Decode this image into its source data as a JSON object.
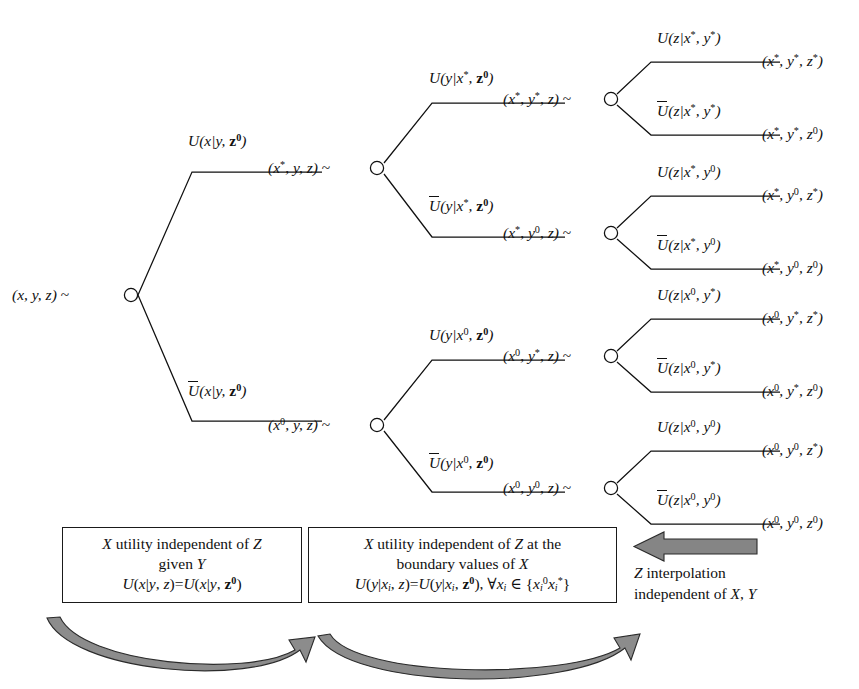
{
  "diagram": {
    "type": "decision-tree",
    "title_present": false,
    "root": {
      "state": "(x, y, z) ~"
    },
    "level1": [
      {
        "branch": "U(x|y, z0)",
        "state": "(x*, y, z) ~"
      },
      {
        "branch": "Ubar(x|y, z0)",
        "state": "(x0, y, z) ~"
      }
    ],
    "level2": [
      {
        "branch": "U(y|x*, z0)",
        "state": "(x*, y*, z) ~"
      },
      {
        "branch": "Ubar(y|x*, z0)",
        "state": "(x*, y0, z) ~"
      },
      {
        "branch": "U(y|x0, z0)",
        "state": "(x0, y*, z) ~"
      },
      {
        "branch": "Ubar(y|x0, z0)",
        "state": "(x0, y0, z) ~"
      }
    ],
    "level3": [
      {
        "branch": "U(z|x*, y*)",
        "state": "(x*, y*, z*)"
      },
      {
        "branch": "Ubar(z|x*, y*)",
        "state": "(x*, y*, z0)"
      },
      {
        "branch": "U(z|x*, y0)",
        "state": "(x*, y0, z*)"
      },
      {
        "branch": "Ubar(z|x*, y0)",
        "state": "(x*, y0, z0)"
      },
      {
        "branch": "U(z|x0, y*)",
        "state": "(x0, y*, z*)"
      },
      {
        "branch": "Ubar(z|x0, y*)",
        "state": "(x0, y*, z0)"
      },
      {
        "branch": "U(z|x0, y0)",
        "state": "(x0, y0, z*)"
      },
      {
        "branch": "Ubar(z|x0, y0)",
        "state": "(x0, y0, z0)"
      }
    ]
  },
  "notes": {
    "box_left": {
      "line1": "X utility independent of Z",
      "line2": "given Y",
      "formula": "U(x|y, z)=U(x|y, z0)"
    },
    "box_right": {
      "line1": "X utility independent of Z at the",
      "line2": "boundary values of X",
      "formula": "U(y|xi, z)=U(y|xi, z0), ∀xi ∈ {xi0, xi*}"
    },
    "caption_right": {
      "line1": "Z interpolation",
      "line2": "independent of X, Y"
    }
  },
  "colors": {
    "line": "#101010",
    "text": "#101010",
    "arrow_fill": "#808080",
    "arrow_stroke": "#1a1a1a",
    "background": "#ffffff"
  }
}
